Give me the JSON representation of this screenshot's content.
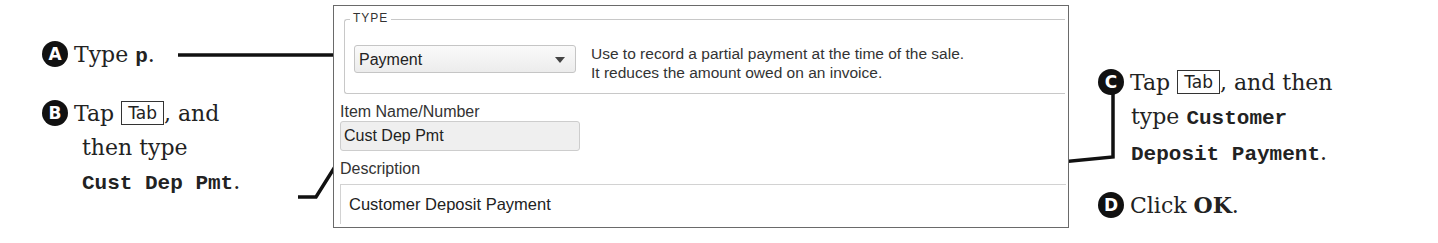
{
  "dialog": {
    "type_section": {
      "legend": "TYPE",
      "selected_type": "Payment",
      "description_line1": "Use to record a partial payment at the time of the sale.",
      "description_line2": "It reduces the amount owed on an invoice."
    },
    "item_name": {
      "label": "Item Name/Number",
      "value": "Cust Dep Pmt"
    },
    "description": {
      "label": "Description",
      "value": "Customer Deposit Payment"
    }
  },
  "steps": [
    {
      "badge": "A",
      "pre": "Type ",
      "code": "p",
      "post": "."
    },
    {
      "badge": "B",
      "pre": "Tap ",
      "key": "Tab",
      "mid": ", and",
      "line2": "then type",
      "code": "Cust Dep Pmt",
      "post": "."
    },
    {
      "badge": "C",
      "pre": "Tap ",
      "key": "Tab",
      "mid": ", and then",
      "line2": "type ",
      "code1": "Customer",
      "code2": "Deposit Payment",
      "post": "."
    },
    {
      "badge": "D",
      "pre": "Click ",
      "bold": "OK",
      "post": "."
    }
  ],
  "colors": {
    "badge": "#111111",
    "frame": "#6a6a6a",
    "input_fill": "#efefef"
  }
}
